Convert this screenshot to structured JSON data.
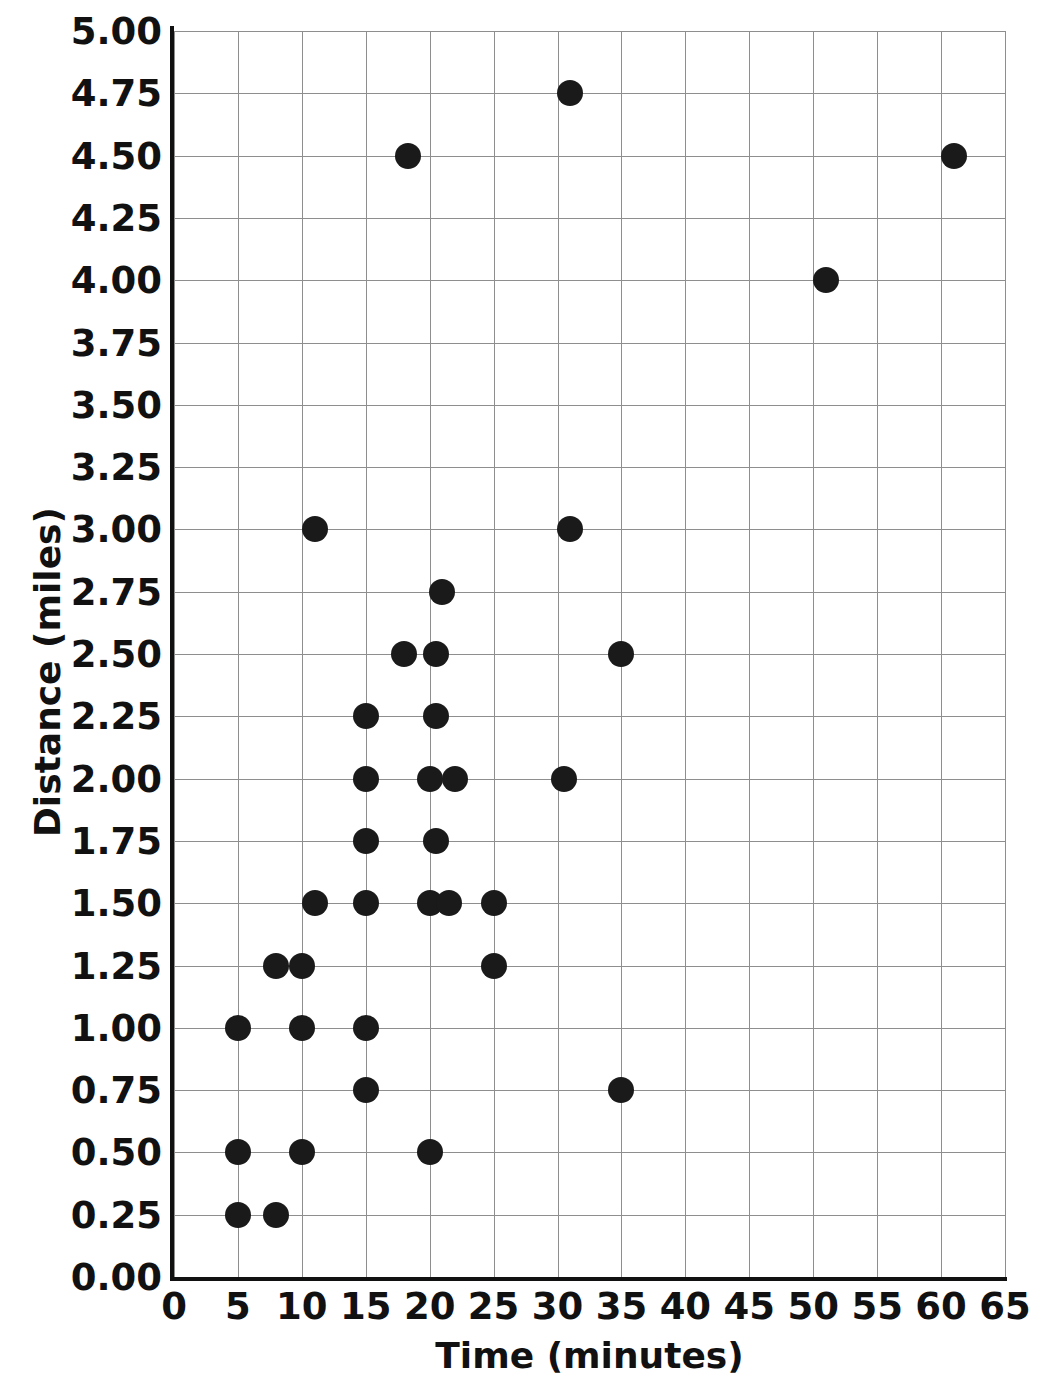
{
  "chart_data": {
    "type": "scatter",
    "title": "",
    "xlabel": "Time (minutes)",
    "ylabel": "Distance (miles)",
    "xlim": [
      0,
      65
    ],
    "ylim": [
      0,
      5
    ],
    "grid": true,
    "legend": "none",
    "marker": {
      "shape": "circle",
      "color": "#1a1a1a",
      "size_px": 26
    },
    "x_ticks": [
      0,
      5,
      10,
      15,
      20,
      25,
      30,
      35,
      40,
      45,
      50,
      55,
      60,
      65
    ],
    "x_tick_labels": [
      "0",
      "5",
      "10",
      "15",
      "20",
      "25",
      "30",
      "35",
      "40",
      "45",
      "50",
      "55",
      "60",
      "65"
    ],
    "y_ticks": [
      0,
      0.25,
      0.5,
      0.75,
      1,
      1.25,
      1.5,
      1.75,
      2,
      2.25,
      2.5,
      2.75,
      3,
      3.25,
      3.5,
      3.75,
      4,
      4.25,
      4.5,
      4.75,
      5
    ],
    "y_tick_labels": [
      "0.00",
      "0.25",
      "0.50",
      "0.75",
      "1.00",
      "1.25",
      "1.50",
      "1.75",
      "2.00",
      "2.25",
      "2.50",
      "2.75",
      "3.00",
      "3.25",
      "3.50",
      "3.75",
      "4.00",
      "4.25",
      "4.50",
      "4.75",
      "5.00"
    ],
    "points": [
      {
        "x": 5,
        "y": 0.25
      },
      {
        "x": 8,
        "y": 0.25
      },
      {
        "x": 5,
        "y": 0.5
      },
      {
        "x": 10,
        "y": 0.5
      },
      {
        "x": 20,
        "y": 0.5
      },
      {
        "x": 15,
        "y": 0.75
      },
      {
        "x": 35,
        "y": 0.75
      },
      {
        "x": 5,
        "y": 1.0
      },
      {
        "x": 10,
        "y": 1.0
      },
      {
        "x": 15,
        "y": 1.0
      },
      {
        "x": 8,
        "y": 1.25
      },
      {
        "x": 10,
        "y": 1.25
      },
      {
        "x": 25,
        "y": 1.25
      },
      {
        "x": 11,
        "y": 1.5
      },
      {
        "x": 15,
        "y": 1.5
      },
      {
        "x": 20,
        "y": 1.5
      },
      {
        "x": 21.5,
        "y": 1.5
      },
      {
        "x": 25,
        "y": 1.5
      },
      {
        "x": 15,
        "y": 1.75
      },
      {
        "x": 20.5,
        "y": 1.75
      },
      {
        "x": 15,
        "y": 2.0
      },
      {
        "x": 20,
        "y": 2.0
      },
      {
        "x": 22,
        "y": 2.0
      },
      {
        "x": 30.5,
        "y": 2.0
      },
      {
        "x": 15,
        "y": 2.25
      },
      {
        "x": 20.5,
        "y": 2.25
      },
      {
        "x": 18,
        "y": 2.5
      },
      {
        "x": 20.5,
        "y": 2.5
      },
      {
        "x": 35,
        "y": 2.5
      },
      {
        "x": 21,
        "y": 2.75
      },
      {
        "x": 11,
        "y": 3.0
      },
      {
        "x": 31,
        "y": 3.0
      },
      {
        "x": 51,
        "y": 4.0
      },
      {
        "x": 18.3,
        "y": 4.5
      },
      {
        "x": 61,
        "y": 4.5
      },
      {
        "x": 31,
        "y": 4.75
      }
    ],
    "point_count": 36
  }
}
